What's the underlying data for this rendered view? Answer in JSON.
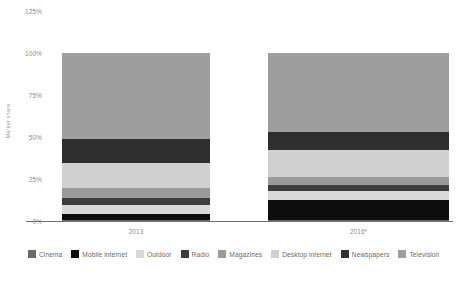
{
  "chart_data": {
    "type": "bar",
    "title": "",
    "subtitle": "",
    "xlabel": "",
    "ylabel": "Market share",
    "categories": [
      "2013",
      "2016*"
    ],
    "ylim": [
      0,
      125
    ],
    "yticks": [
      "0%",
      "25%",
      "50%",
      "75%",
      "100%",
      "125%"
    ],
    "ytick_values": [
      0,
      25,
      50,
      75,
      100,
      125
    ],
    "grid": false,
    "stacked": true,
    "legend_position": "bottom",
    "series": [
      {
        "name": "Cinema",
        "color": "#6b6b6b",
        "values": [
          0.6,
          0.6
        ]
      },
      {
        "name": "Mobile internet",
        "color": "#0d0d0d",
        "values": [
          3.6,
          11.9
        ]
      },
      {
        "name": "Outdoor",
        "color": "#d9d9d9",
        "values": [
          5.4,
          5.4
        ]
      },
      {
        "name": "Radio",
        "color": "#3d3d3d",
        "values": [
          4.2,
          3.6
        ]
      },
      {
        "name": "Magazines",
        "color": "#9a9a9a",
        "values": [
          6.0,
          4.8
        ]
      },
      {
        "name": "Desktop internet",
        "color": "#d0d0d0",
        "values": [
          14.9,
          16.1
        ]
      },
      {
        "name": "Newspapers",
        "color": "#2e2e2e",
        "values": [
          14.3,
          10.7
        ]
      },
      {
        "name": "Television",
        "color": "#9e9e9e",
        "values": [
          51.0,
          46.9
        ]
      }
    ]
  },
  "axis": {
    "y_title": "Market share",
    "ticks": [
      "125%",
      "100%",
      "75%",
      "50%",
      "25%",
      "0%"
    ]
  },
  "xaxis": {
    "labels": [
      "2013",
      "2016*"
    ]
  },
  "legend": {
    "items": [
      {
        "label": "Cinema",
        "color": "#6b6b6b"
      },
      {
        "label": "Mobile internet",
        "color": "#0d0d0d"
      },
      {
        "label": "Outdoor",
        "color": "#d9d9d9"
      },
      {
        "label": "Radio",
        "color": "#3d3d3d"
      },
      {
        "label": "Magazines",
        "color": "#9a9a9a"
      },
      {
        "label": "Desktop internet",
        "color": "#d0d0d0"
      },
      {
        "label": "Newspapers",
        "color": "#2e2e2e"
      },
      {
        "label": "Television",
        "color": "#9e9e9e"
      }
    ]
  },
  "footnote": {
    "text": ""
  }
}
